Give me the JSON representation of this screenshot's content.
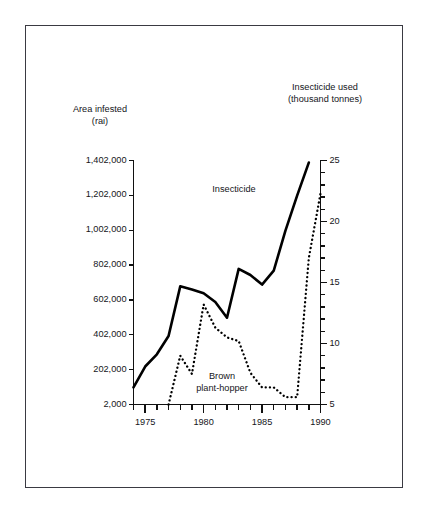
{
  "chart_data": {
    "type": "line",
    "title": "",
    "subtitle": "",
    "xlabel": "",
    "ylabel": "Area infested (rai)",
    "y2label": "Insecticide used (thousand tonnes)",
    "grid": false,
    "legend_position": "inline-annotations",
    "xlim": [
      1974,
      1990
    ],
    "x_ticks_major": [
      1975,
      1980,
      1985,
      1990
    ],
    "x_tick_labels": [
      "1975",
      "1980",
      "1985",
      "1990"
    ],
    "x_ticks_minor_step": 1,
    "ylim": [
      2000,
      1402000
    ],
    "y_ticks": [
      2000,
      202000,
      402000,
      602000,
      802000,
      1002000,
      1202000,
      1402000
    ],
    "y_tick_labels": [
      "2,000",
      "202,000",
      "402,000",
      "602,000",
      "802,000",
      "1,002,000",
      "1,202,000",
      "1,402,000"
    ],
    "y2lim": [
      5,
      25
    ],
    "y2_ticks": [
      5,
      10,
      15,
      20,
      25
    ],
    "y2_tick_labels": [
      "5",
      "10",
      "15",
      "20",
      "25"
    ],
    "y2_ticks_minor_step": 1,
    "series": [
      {
        "name": "Insecticide",
        "axis": "left",
        "style": "solid",
        "color": "#000000",
        "x": [
          1974,
          1975,
          1976,
          1977,
          1978,
          1979,
          1980,
          1981,
          1982,
          1983,
          1984,
          1985,
          1986,
          1987,
          1988,
          1989
        ],
        "values": [
          100000,
          220000,
          290000,
          395000,
          680000,
          662000,
          640000,
          590000,
          500000,
          780000,
          745000,
          690000,
          770000,
          1000000,
          1200000,
          1390000
        ]
      },
      {
        "name": "Brown plant-hopper",
        "axis": "right",
        "style": "dotted",
        "color": "#000000",
        "x": [
          1977,
          1978,
          1979,
          1980,
          1981,
          1982,
          1983,
          1984,
          1985,
          1986,
          1987,
          1988,
          1989,
          1990
        ],
        "values": [
          5.0,
          9.0,
          7.5,
          13.2,
          11.3,
          10.5,
          10.2,
          7.6,
          6.4,
          6.4,
          5.6,
          5.6,
          17.0,
          22.3
        ]
      }
    ],
    "annotations": [
      {
        "text": "Insecticide",
        "x": 1984.0,
        "y_axis": "left",
        "y": 1180000
      },
      {
        "text": "Brown plant-hopper",
        "x": 1982.2,
        "y_axis": "right",
        "y": 6.4
      }
    ]
  },
  "axes": {
    "left_title_line1": "Area infested",
    "left_title_line2": "(rai)",
    "right_title_line1": "Insecticide used",
    "right_title_line2": "(thousand tonnes)"
  },
  "labels": {
    "series_insecticide": "Insecticide",
    "series_hopper_line1": "Brown",
    "series_hopper_line2": "plant-hopper"
  }
}
